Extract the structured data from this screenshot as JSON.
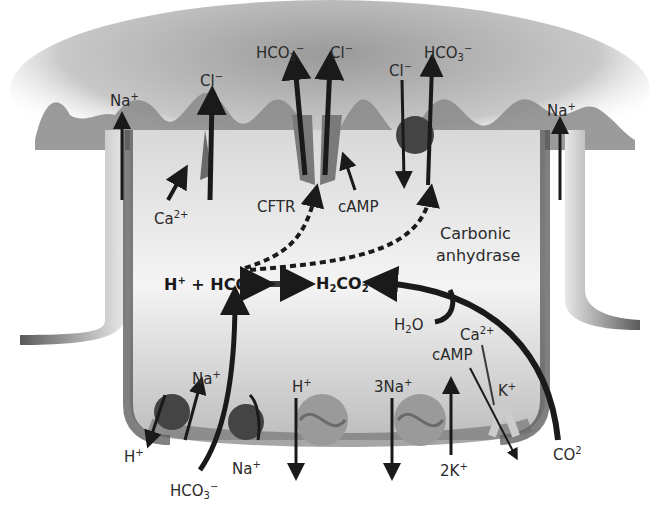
{
  "diagram": {
    "type": "cell ion-transport schematic",
    "region_labels": {
      "apical": "lumen (top, grey gradient with microvilli)",
      "basolateral": "bottom membrane"
    },
    "colors": {
      "ink": "#1a1a1a",
      "membrane_dark": "#4a4a4a",
      "membrane_mid": "#8a8a8a",
      "lumen": "#bdbdbd",
      "transporter": "#9a9a9a",
      "transporter_dark": "#444444",
      "background": "#ffffff"
    },
    "labels": {
      "na_apical_left": {
        "base": "Na",
        "sup": "+"
      },
      "cl_left": {
        "base": "Cl",
        "sup": "−"
      },
      "ca_apical": {
        "base": "Ca",
        "sup": "2+"
      },
      "hco3_cftr": {
        "base": "HCO",
        "sub": "3",
        "sup": "−"
      },
      "cl_cftr": {
        "base": "Cl",
        "sup": "−"
      },
      "cftr": "CFTR",
      "camp_apical": "cAMP",
      "cl_exchanger": {
        "base": "Cl",
        "sup": "−"
      },
      "hco3_exchanger": {
        "base": "HCO",
        "sub": "3",
        "sup": "−"
      },
      "na_apical_right": {
        "base": "Na",
        "sup": "+"
      },
      "carbonic_1": "Carbonic",
      "carbonic_2": "anhydrase",
      "eq_left": {
        "h": "H",
        "hsup": "+",
        "plus": " + ",
        "hco": "HCO",
        "sub": "3"
      },
      "eq_right": {
        "h": "H",
        "sub1": "2",
        "co": "CO",
        "sub2": "2"
      },
      "h2o": {
        "h": "H",
        "sub": "2",
        "o": "O"
      },
      "ca_baso": {
        "base": "Ca",
        "sup": "2+"
      },
      "camp_baso": "cAMP",
      "k_channel": {
        "base": "K",
        "sup": "+"
      },
      "na_nhe": {
        "base": "Na",
        "sup": "+"
      },
      "h_nhe": {
        "base": "H",
        "sup": "+"
      },
      "hco3_nbc": {
        "base": "HCO",
        "sub": "3",
        "sup": "−"
      },
      "na_nbc": {
        "base": "Na",
        "sup": "+"
      },
      "h_pump": {
        "base": "H",
        "sup": "+"
      },
      "na3": {
        "base": "3Na",
        "sup": "+"
      },
      "k2": {
        "base": "2K",
        "sup": "+"
      },
      "co2": {
        "base": "CO",
        "sup": "2"
      }
    }
  }
}
